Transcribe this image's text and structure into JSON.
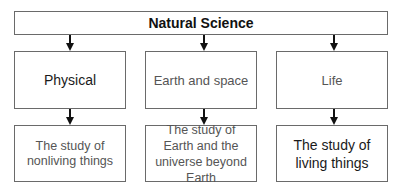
{
  "root": {
    "label": "Natural Science"
  },
  "categories": [
    {
      "label": "Physical",
      "description": "The study of nonliving things"
    },
    {
      "label": "Earth and space",
      "description": "The study of Earth and the universe beyond Earth"
    },
    {
      "label": "Life",
      "description": "The study of living things"
    }
  ],
  "colors": {
    "border": "#6a6a6a",
    "arrow": "#111111",
    "text": "#1a1a1a"
  }
}
